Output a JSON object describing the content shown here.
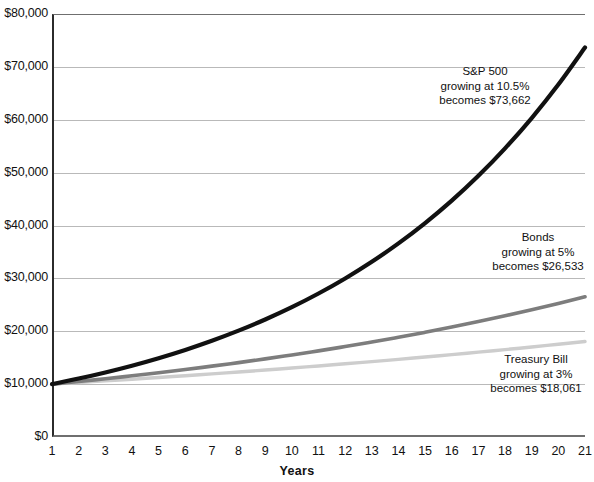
{
  "chart_data": {
    "type": "line",
    "title": "",
    "xlabel": "Years",
    "ylabel": "",
    "xlim": [
      1,
      21
    ],
    "ylim": [
      0,
      80000
    ],
    "grid": true,
    "legend_position": "inline-annotations",
    "x": [
      1,
      2,
      3,
      4,
      5,
      6,
      7,
      8,
      9,
      10,
      11,
      12,
      13,
      14,
      15,
      16,
      17,
      18,
      19,
      20,
      21
    ],
    "xtick_labels": [
      "1",
      "2",
      "3",
      "4",
      "5",
      "6",
      "7",
      "8",
      "9",
      "10",
      "11",
      "12",
      "13",
      "14",
      "15",
      "16",
      "17",
      "18",
      "19",
      "20",
      "21"
    ],
    "ytick_labels": [
      "$80,000",
      "$70,000",
      "$60,000",
      "$50,000",
      "$40,000",
      "$30,000",
      "$20,000",
      "$10,000",
      "$0"
    ],
    "ytick_values": [
      80000,
      70000,
      60000,
      50000,
      40000,
      30000,
      20000,
      10000,
      0
    ],
    "series": [
      {
        "name": "S&P 500",
        "rate_percent": 10.5,
        "start_value": 10000,
        "end_value": 73662,
        "color": "#111111",
        "values": [
          10000,
          11050,
          12210,
          13492,
          14908,
          16473,
          18203,
          20114,
          22226,
          24560,
          27139,
          29989,
          33138,
          36618,
          40463,
          44711,
          49406,
          54594,
          60326,
          66660,
          73662
        ]
      },
      {
        "name": "Bonds",
        "rate_percent": 5,
        "start_value": 10000,
        "end_value": 26533,
        "color": "#7d7d7d",
        "values": [
          10000,
          10500,
          11025,
          11576,
          12155,
          12763,
          13401,
          14071,
          14775,
          15513,
          16289,
          17103,
          17959,
          18856,
          19799,
          20789,
          21829,
          22920,
          24066,
          25270,
          26533
        ]
      },
      {
        "name": "Treasury Bill",
        "rate_percent": 3,
        "start_value": 10000,
        "end_value": 18061,
        "color": "#cdcdcd",
        "values": [
          10000,
          10300,
          10609,
          10927,
          11255,
          11593,
          11941,
          12299,
          12668,
          13048,
          13439,
          13842,
          14258,
          14685,
          15126,
          15580,
          16047,
          16528,
          17024,
          17535,
          18061
        ]
      }
    ]
  },
  "annotations": {
    "sp500": {
      "title": "S&P 500",
      "line2": "growing at 10.5%",
      "line3": "becomes $73,662"
    },
    "bonds": {
      "title": "Bonds",
      "line2": "growing at 5%",
      "line3": "becomes $26,533"
    },
    "tbill": {
      "title": "Treasury Bill",
      "line2": "growing at 3%",
      "line3": "becomes $18,061"
    }
  },
  "axis": {
    "x_title": "Years"
  }
}
